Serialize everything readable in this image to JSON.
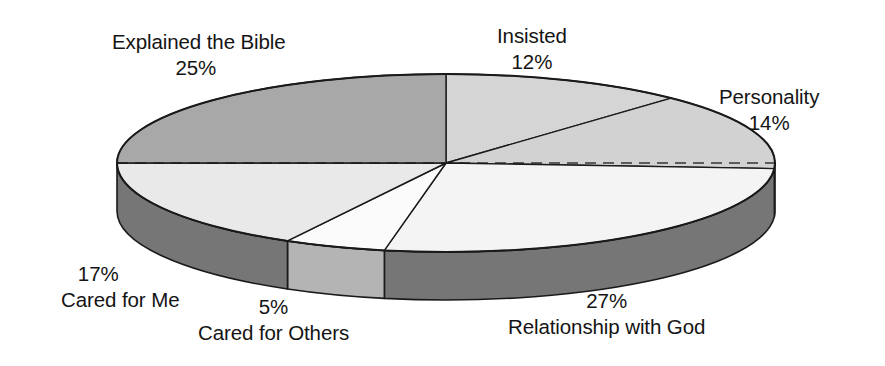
{
  "chart_data": {
    "type": "pie",
    "title": "",
    "subtitle": "",
    "xlabel": "",
    "ylabel": "",
    "legend_position": "none",
    "grid": false,
    "three_d": true,
    "value_unit": "%",
    "start_angle_deg": 0,
    "direction": "clockwise",
    "categories": [
      "Insisted",
      "Personality",
      "Relationship with God",
      "Cared for Others",
      "Cared for Me",
      "Explained the Bible"
    ],
    "values": [
      12,
      14,
      27,
      5,
      17,
      25
    ],
    "slices": [
      {
        "label": "Insisted",
        "value": 12,
        "display": "12%",
        "top_color": "#d5d5d5",
        "side_color": "#767676",
        "label_id": "label-insisted"
      },
      {
        "label": "Personality",
        "value": 14,
        "display": "14%",
        "top_color": "#d2d2d2",
        "side_color": "#767676",
        "label_id": "label-personality"
      },
      {
        "label": "Relationship with God",
        "value": 27,
        "display": "27%",
        "top_color": "#f4f4f4",
        "side_color": "#767676",
        "label_id": "label-relationship-with-god"
      },
      {
        "label": "Cared for Others",
        "value": 5,
        "display": "5%",
        "top_color": "#fbfbfb",
        "side_color": "#b4b4b4",
        "label_id": "label-cared-for-others"
      },
      {
        "label": "Cared for Me",
        "value": 17,
        "display": "17%",
        "top_color": "#e9e9e9",
        "side_color": "#767676",
        "label_id": "label-cared-for-me"
      },
      {
        "label": "Explained the Bible",
        "value": 25,
        "display": "25%",
        "top_color": "#a8a8a8",
        "side_color": "#767676",
        "label_id": "label-explained-the-bible"
      }
    ]
  },
  "labels": {
    "insisted": {
      "name": "Insisted",
      "pct": "12%"
    },
    "personality": {
      "name": "Personality",
      "pct": "14%"
    },
    "relationship_with_god": {
      "name": "Relationship with God",
      "pct": "27%"
    },
    "cared_for_others": {
      "name": "Cared for Others",
      "pct": "5%"
    },
    "cared_for_me": {
      "name": "Cared for Me",
      "pct": "17%"
    },
    "explained_the_bible": {
      "name": "Explained the Bible",
      "pct": "25%"
    }
  },
  "colors": {
    "background": "#ffffff",
    "outline": "#1a1a1a",
    "text": "#141414",
    "slice_dark_gray": "#a8a8a8",
    "slice_light_gray": "#d5d5d5",
    "slice_white": "#f4f4f4",
    "side_wall_dark": "#767676",
    "side_wall_light": "#b4b4b4"
  },
  "geometry": {
    "center_x": 446,
    "center_y": 163,
    "radius_x": 329,
    "radius_y": 89,
    "depth": 48
  }
}
